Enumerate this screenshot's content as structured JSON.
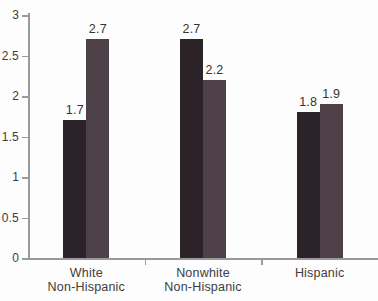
{
  "chart_data": {
    "type": "bar",
    "categories": [
      "White\nNon-Hispanic",
      "Nonwhite\nNon-Hispanic",
      "Hispanic"
    ],
    "series": [
      {
        "name": "series-1-dark",
        "color": "#2b2327",
        "values": [
          1.7,
          2.7,
          1.8
        ]
      },
      {
        "name": "series-2-light",
        "color": "#4d4147",
        "values": [
          2.7,
          2.2,
          1.9
        ]
      }
    ],
    "value_labels": {
      "series-1-dark": [
        "1.7",
        "2.7",
        "1.8"
      ],
      "series-2-light": [
        "2.7",
        "2.2",
        "1.9"
      ]
    },
    "title": "",
    "xlabel": "",
    "ylabel": "",
    "ylim": [
      0,
      3
    ],
    "yticks": [
      0,
      0.5,
      1,
      1.5,
      2,
      2.5,
      3
    ],
    "ytick_labels": [
      "0",
      "0.5",
      "1",
      "1.5",
      "2",
      "2.5",
      "3"
    ],
    "grid": false,
    "legend": "none",
    "colors": {
      "axis": "#9a9a9a",
      "tick_text": "#3e3c40",
      "value_text": "#343236",
      "category_text": "#3e3c40",
      "background": "#fdfdfd"
    }
  }
}
